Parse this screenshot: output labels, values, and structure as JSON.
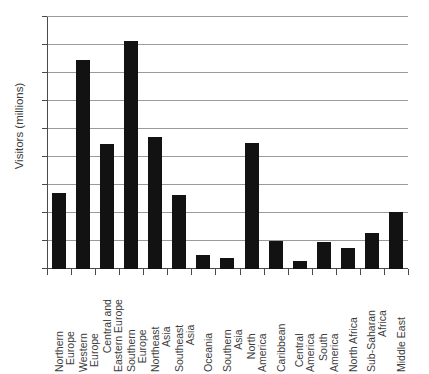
{
  "chart_data": {
    "type": "bar",
    "title": "",
    "xlabel": "",
    "ylabel": "Visitors (millions)",
    "ylim": [
      0,
      180
    ],
    "ytick_values": [
      0,
      20,
      40,
      60,
      80,
      100,
      120,
      140,
      160,
      180
    ],
    "ytick_labels": [
      "0",
      "20",
      "40",
      "60",
      "80",
      "100",
      "120",
      "140",
      "160",
      "180"
    ],
    "grid": true,
    "grid_axis": "y",
    "legend": "none",
    "bar_color": "#121212",
    "categories": [
      "Northern Europe",
      "Western Europe",
      "Central and Eastern Europe",
      "Southern Europe",
      "Northeast Asia",
      "Southeast Asia",
      "Oceania",
      "Southern Asia",
      "North America",
      "Caribbean",
      "Central America",
      "South America",
      "North Africa",
      "Sub-Saharan Africa",
      "Middle East"
    ],
    "category_lines": [
      [
        "Northern",
        "Europe"
      ],
      [
        "Western",
        "Europe"
      ],
      [
        "Central and",
        "Eastern Europe"
      ],
      [
        "Southern",
        "Europe"
      ],
      [
        "Northeast",
        "Asia"
      ],
      [
        "Southeast",
        "Asia"
      ],
      [
        "Oceania"
      ],
      [
        "Southern",
        "Asia"
      ],
      [
        "North",
        "America"
      ],
      [
        "Caribbean"
      ],
      [
        "Central",
        "America"
      ],
      [
        "South",
        "America"
      ],
      [
        "North Africa"
      ],
      [
        "Sub-Saharan",
        "Africa"
      ],
      [
        "Middle East"
      ]
    ],
    "values": [
      54,
      149,
      89,
      163,
      94,
      53,
      10,
      8,
      90,
      20,
      6,
      19,
      15,
      26,
      41
    ]
  }
}
